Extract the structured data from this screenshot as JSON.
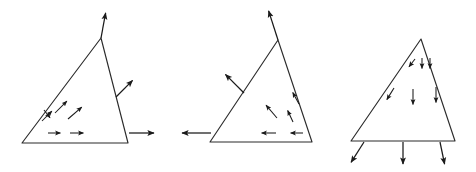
{
  "figure": {
    "width": 476,
    "height": 172,
    "background_color": "#ffffff",
    "line_color": "#2b2b2b",
    "arrow_color": "#1a1a1a"
  },
  "panels": [
    {
      "id": "panel-left",
      "label": "left-triangle",
      "triangle": {
        "vertices": [
          [
            22,
            143
          ],
          [
            101,
            38
          ],
          [
            128,
            143
          ]
        ],
        "description": "scalene triangle, apex upper-left-of-center, horizontal base"
      },
      "boundary_arrows": [
        {
          "name": "apex-normal-arrow",
          "from": [
            101,
            38
          ],
          "to": [
            106,
            11
          ],
          "direction": "up-right"
        },
        {
          "name": "right-edge-normal-arrow",
          "from": [
            116,
            97
          ],
          "to": [
            134,
            79
          ],
          "direction": "up-right"
        },
        {
          "name": "base-right-normal-arrow",
          "from": [
            129,
            133
          ],
          "to": [
            156,
            133
          ],
          "direction": "right"
        }
      ],
      "field_arrows": [
        {
          "name": "field-arrow-1",
          "from": [
            55,
            113
          ],
          "to": [
            68,
            100
          ],
          "direction": "up-right"
        },
        {
          "name": "field-arrow-2",
          "from": [
            42,
            121
          ],
          "to": [
            53,
            110
          ],
          "direction": "up-right"
        },
        {
          "name": "field-arrow-3",
          "from": [
            44,
            110
          ],
          "to": [
            51,
            119
          ],
          "direction": "down-right"
        },
        {
          "name": "field-arrow-4",
          "from": [
            68,
            119
          ],
          "to": [
            83,
            106
          ],
          "direction": "up-right"
        },
        {
          "name": "field-arrow-5",
          "from": [
            48,
            133
          ],
          "to": [
            62,
            133
          ],
          "direction": "right"
        },
        {
          "name": "field-arrow-6",
          "from": [
            70,
            133
          ],
          "to": [
            85,
            133
          ],
          "direction": "right"
        }
      ]
    },
    {
      "id": "panel-middle",
      "label": "middle-triangle",
      "triangle": {
        "vertices": [
          [
            210,
            142
          ],
          [
            278,
            40
          ],
          [
            312,
            142
          ]
        ],
        "description": "scalene triangle mirrored relative to left panel, apex upper-center"
      },
      "boundary_arrows": [
        {
          "name": "apex-normal-arrow",
          "from": [
            278,
            40
          ],
          "to": [
            268,
            9
          ],
          "direction": "up-left"
        },
        {
          "name": "left-edge-normal-arrow",
          "from": [
            244,
            93
          ],
          "to": [
            224,
            73
          ],
          "direction": "up-left"
        },
        {
          "name": "base-left-normal-arrow",
          "from": [
            211,
            133
          ],
          "to": [
            180,
            133
          ],
          "direction": "left"
        }
      ],
      "field_arrows": [
        {
          "name": "field-arrow-1",
          "from": [
            299,
            104
          ],
          "to": [
            292,
            91
          ],
          "direction": "up-left"
        },
        {
          "name": "field-arrow-2",
          "from": [
            277,
            118
          ],
          "to": [
            265,
            104
          ],
          "direction": "up-left"
        },
        {
          "name": "field-arrow-3",
          "from": [
            293,
            122
          ],
          "to": [
            287,
            109
          ],
          "direction": "up-left"
        },
        {
          "name": "field-arrow-4",
          "from": [
            276,
            133
          ],
          "to": [
            260,
            133
          ],
          "direction": "left"
        },
        {
          "name": "field-arrow-5",
          "from": [
            303,
            133
          ],
          "to": [
            289,
            133
          ],
          "direction": "left"
        }
      ]
    },
    {
      "id": "panel-right",
      "label": "right-triangle",
      "triangle": {
        "vertices": [
          [
            351,
            141
          ],
          [
            421,
            39
          ],
          [
            455,
            141
          ]
        ],
        "description": "narrow triangle, apex top-center-right, horizontal base"
      },
      "boundary_arrows": [
        {
          "name": "base-normal-arrow-left",
          "from": [
            364,
            142
          ],
          "to": [
            350,
            164
          ],
          "direction": "down-left"
        },
        {
          "name": "base-normal-arrow-center",
          "from": [
            403,
            142
          ],
          "to": [
            403,
            166
          ],
          "direction": "down"
        },
        {
          "name": "base-normal-arrow-right",
          "from": [
            440,
            142
          ],
          "to": [
            445,
            166
          ],
          "direction": "down-right"
        }
      ],
      "field_arrows": [
        {
          "name": "field-arrow-1",
          "from": [
            415,
            59
          ],
          "to": [
            408,
            68
          ],
          "direction": "down-left"
        },
        {
          "name": "field-arrow-2",
          "from": [
            422,
            58
          ],
          "to": [
            422,
            70
          ],
          "direction": "down"
        },
        {
          "name": "field-arrow-3",
          "from": [
            430,
            58
          ],
          "to": [
            430,
            70
          ],
          "direction": "down"
        },
        {
          "name": "field-arrow-4",
          "from": [
            394,
            88
          ],
          "to": [
            386,
            101
          ],
          "direction": "down-left"
        },
        {
          "name": "field-arrow-5",
          "from": [
            413,
            89
          ],
          "to": [
            413,
            106
          ],
          "direction": "down"
        },
        {
          "name": "field-arrow-6",
          "from": [
            436,
            87
          ],
          "to": [
            436,
            104
          ],
          "direction": "down"
        }
      ]
    }
  ]
}
